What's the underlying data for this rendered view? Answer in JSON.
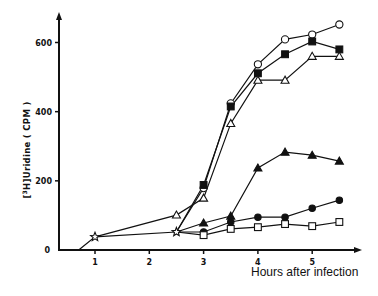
{
  "chart_data": {
    "type": "line",
    "title": "",
    "xlabel": "Hours after infection",
    "ylabel": "[3H]Uridine (CPM)",
    "xlim": [
      0.33,
      5.9
    ],
    "ylim": [
      0,
      680
    ],
    "xticks": [
      1,
      2,
      3,
      4,
      5
    ],
    "yticks": [
      0,
      200,
      400,
      600
    ],
    "grid": false,
    "legend": "none",
    "shared_start": {
      "marker": "open-star",
      "x": [
        0.7,
        1,
        2.5
      ],
      "y": [
        0,
        38,
        52
      ]
    },
    "series": [
      {
        "name": "open-circle",
        "marker": "open-circle",
        "x": [
          2.5,
          3,
          3.5,
          4,
          4.5,
          5,
          5.5
        ],
        "y": [
          52,
          179,
          424,
          537,
          609,
          623,
          652
        ]
      },
      {
        "name": "filled-square",
        "marker": "filled-square",
        "x": [
          2.5,
          3,
          3.5,
          4,
          4.5,
          5,
          5.5
        ],
        "y": [
          52,
          188,
          415,
          511,
          566,
          603,
          580
        ]
      },
      {
        "name": "open-triangle",
        "marker": "open-triangle",
        "x": [
          1,
          2.5,
          3,
          3.5,
          4,
          4.5,
          5,
          5.5
        ],
        "y": [
          38,
          101,
          150,
          366,
          491,
          491,
          560,
          560
        ]
      },
      {
        "name": "filled-triangle",
        "marker": "filled-triangle",
        "x": [
          2.5,
          3,
          3.5,
          4,
          4.5,
          5,
          5.5
        ],
        "y": [
          52,
          78,
          98,
          237,
          283,
          274,
          257
        ]
      },
      {
        "name": "filled-circle",
        "marker": "filled-circle",
        "x": [
          2.5,
          3,
          3.5,
          4,
          4.5,
          5,
          5.5
        ],
        "y": [
          52,
          52,
          81,
          95,
          95,
          121,
          144
        ]
      },
      {
        "name": "open-square",
        "marker": "open-square",
        "x": [
          2.5,
          3,
          3.5,
          4,
          4.5,
          5,
          5.5
        ],
        "y": [
          52,
          43,
          61,
          66,
          75,
          69,
          81
        ]
      }
    ]
  }
}
